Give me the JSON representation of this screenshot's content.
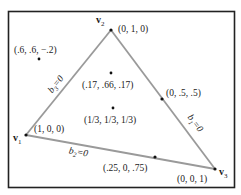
{
  "diagram": {
    "type": "barycentric-triangle",
    "frame": {
      "x": 8,
      "y": 11,
      "width": 227,
      "height": 177,
      "stroke": "#222222"
    },
    "edge_color": "#9a9a9a",
    "point_color": "#111111",
    "vertices": [
      {
        "id": "v1",
        "label": "v",
        "sub": "1",
        "x": 26,
        "y": 135,
        "coord": "(1, 0, 0)"
      },
      {
        "id": "v2",
        "label": "v",
        "sub": "2",
        "x": 111,
        "y": 30,
        "coord": "(0, 1, 0)"
      },
      {
        "id": "v3",
        "label": "v",
        "sub": "3",
        "x": 215,
        "y": 169,
        "coord": "(0, 0, 1)"
      }
    ],
    "edges": [
      {
        "id": "b3",
        "label": "b",
        "sub": "3",
        "eq": "=0",
        "from": "v1",
        "to": "v2"
      },
      {
        "id": "b1",
        "label": "b",
        "sub": "1",
        "eq": "=0",
        "from": "v2",
        "to": "v3"
      },
      {
        "id": "b2",
        "label": "b",
        "sub": "2",
        "eq": "=0",
        "from": "v1",
        "to": "v3"
      }
    ],
    "points": [
      {
        "id": "outside",
        "coord": "(.6, .6, −.2)",
        "x": 39,
        "y": 59
      },
      {
        "id": "near-v2",
        "coord": "(.17, .66, .17)",
        "x": 111,
        "y": 73
      },
      {
        "id": "centroid",
        "coord": "(1/3, 1/3, 1/3)",
        "x": 113,
        "y": 108
      },
      {
        "id": "mid-v2v3",
        "coord": "(0, .5, .5)",
        "x": 162,
        "y": 99
      },
      {
        "id": "on-v1v3",
        "coord": "(.25, 0, .75)",
        "x": 155,
        "y": 157
      }
    ]
  }
}
